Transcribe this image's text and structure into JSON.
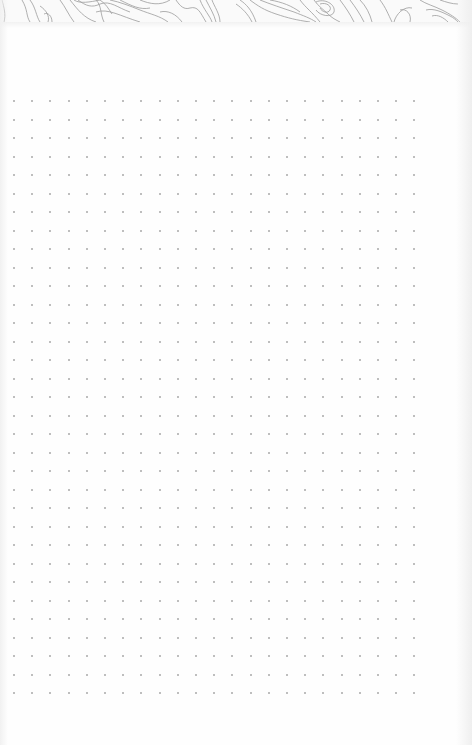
{
  "page": {
    "type": "dot-grid notebook page",
    "background_color": "#fefefe",
    "header": {
      "pattern": "topographic-contour-lines",
      "line_color": "#9a9a9a",
      "height_px": 22
    },
    "dot_grid": {
      "dot_color": "#a9a9a9",
      "start_x": 14,
      "start_y": 101,
      "spacing_x": 18.2,
      "spacing_y": 18.5,
      "columns": 23,
      "rows": 33
    }
  }
}
